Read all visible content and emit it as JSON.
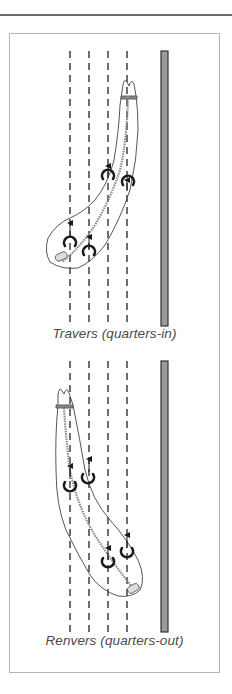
{
  "figure": {
    "diagrams": [
      {
        "id": "travers",
        "caption": "Travers (quarters-in)"
      },
      {
        "id": "renvers",
        "caption": "Renvers (quarters-out)"
      }
    ],
    "colors": {
      "line": "#222222",
      "wall_fill": "#9a9a9a",
      "frame_border": "#b5b5b5",
      "caption_text": "#4a4a4a",
      "spine": "#8a8a8a"
    }
  }
}
